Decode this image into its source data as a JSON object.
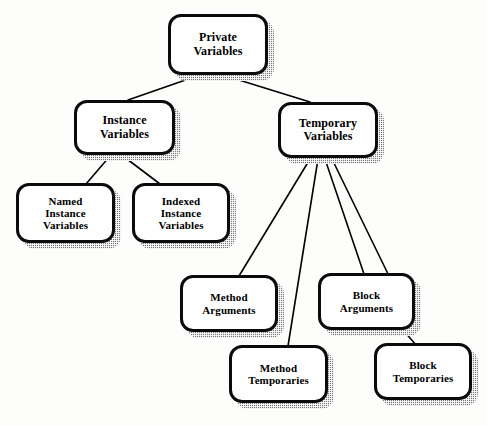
{
  "diagram": {
    "type": "tree-diagram",
    "background_color": "#fdfdfc",
    "node_fill_color": "#ffffff",
    "node_border_color": "#0b0b0b",
    "node_shadow_color": "#777777",
    "edge_color": "#000000",
    "nodes": [
      {
        "id": "private-variables",
        "label": "Private\nVariables",
        "line1": "Private",
        "line2": "Variables",
        "x": 168,
        "y": 14,
        "w": 100,
        "h": 61,
        "font_size": 12
      },
      {
        "id": "instance-variables",
        "label": "Instance\nVariables",
        "line1": "Instance",
        "line2": "Variables",
        "x": 74,
        "y": 100,
        "w": 101,
        "h": 55,
        "font_size": 12
      },
      {
        "id": "temporary-variables",
        "label": "Temporary\nVariables",
        "line1": "Temporary",
        "line2": "Variables",
        "x": 278,
        "y": 102,
        "w": 100,
        "h": 56,
        "font_size": 12
      },
      {
        "id": "named-instance-variables",
        "label": "Named\nInstance\nVariables",
        "line1": "Named",
        "line2": "Instance",
        "line3": "Variables",
        "x": 16,
        "y": 183,
        "w": 99,
        "h": 60,
        "font_size": 11
      },
      {
        "id": "indexed-instance-variables",
        "label": "Indexed\nInstance\nVariables",
        "line1": "Indexed",
        "line2": "Instance",
        "line3": "Variables",
        "x": 132,
        "y": 183,
        "w": 98,
        "h": 60,
        "font_size": 11
      },
      {
        "id": "method-arguments",
        "label": "Method\nArguments",
        "line1": "Method",
        "line2": "Arguments",
        "x": 180,
        "y": 275,
        "w": 98,
        "h": 57,
        "font_size": 11
      },
      {
        "id": "block-arguments",
        "label": "Block\nArguments",
        "line1": "Block",
        "line2": "Arguments",
        "x": 318,
        "y": 273,
        "w": 97,
        "h": 57,
        "font_size": 11
      },
      {
        "id": "method-temporaries",
        "label": "Method\nTemporaries",
        "line1": "Method",
        "line2": "Temporaries",
        "x": 229,
        "y": 345,
        "w": 99,
        "h": 58,
        "font_size": 11
      },
      {
        "id": "block-temporaries",
        "label": "Block\nTemporaries",
        "line1": "Block",
        "line2": "Temporaries",
        "x": 374,
        "y": 343,
        "w": 98,
        "h": 57,
        "font_size": 11
      }
    ],
    "edges": [
      {
        "id": "edge-private-to-instance",
        "from": "private-variables",
        "to": "instance-variables",
        "x1": 197,
        "y1": 76,
        "x2": 128,
        "y2": 100
      },
      {
        "id": "edge-private-to-temporary",
        "from": "private-variables",
        "to": "temporary-variables",
        "x1": 226,
        "y1": 76,
        "x2": 310,
        "y2": 102
      },
      {
        "id": "edge-instance-to-named",
        "from": "instance-variables",
        "to": "named-instance-variables",
        "x1": 110,
        "y1": 156,
        "x2": 86,
        "y2": 184
      },
      {
        "id": "edge-instance-to-indexed",
        "from": "instance-variables",
        "to": "indexed-instance-variables",
        "x1": 123,
        "y1": 156,
        "x2": 160,
        "y2": 184
      },
      {
        "id": "edge-temporary-to-method-arguments",
        "from": "temporary-variables",
        "to": "method-arguments",
        "x1": 310,
        "y1": 159,
        "x2": 239,
        "y2": 276
      },
      {
        "id": "edge-temporary-to-method-temporaries",
        "from": "temporary-variables",
        "to": "method-temporaries",
        "x1": 318,
        "y1": 159,
        "x2": 288,
        "y2": 346
      },
      {
        "id": "edge-temporary-to-block-arguments",
        "from": "temporary-variables",
        "to": "block-arguments",
        "x1": 325,
        "y1": 159,
        "x2": 364,
        "y2": 274
      },
      {
        "id": "edge-temporary-to-block-temporaries",
        "from": "temporary-variables",
        "to": "block-temporaries",
        "x1": 332,
        "y1": 159,
        "x2": 390,
        "y2": 278
      },
      {
        "id": "edge-block-arguments-to-block-temporaries",
        "from": "block-arguments",
        "to": "block-temporaries",
        "x1": 404,
        "y1": 331,
        "x2": 416,
        "y2": 345
      }
    ]
  }
}
